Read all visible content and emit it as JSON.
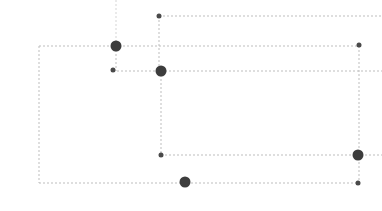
{
  "canvas": {
    "width": 382,
    "height": 211,
    "background": "#ffffff",
    "title": "node-link grid diagram"
  },
  "style": {
    "edge_color": "#bdbdbd",
    "edge_color_faint": "#d5d5d5",
    "edge_width": 1,
    "edge_dash": "2,2",
    "node_color": "#3d3d3d",
    "node_color_soft": "#4a4a4a",
    "node_radius_large": 5.5,
    "node_radius_small": 2.5
  },
  "edges": [
    {
      "id": "e-top-vertical-stub",
      "name": "edge-top-vertical-stub",
      "x1": 116,
      "y1": 0,
      "x2": 116,
      "y2": 46,
      "tone": "faint"
    },
    {
      "id": "e-top-horizontal",
      "name": "edge-top-horizontal",
      "x1": 159,
      "y1": 16,
      "x2": 382,
      "y2": 16,
      "tone": "normal"
    },
    {
      "id": "e-node-b-vertical",
      "name": "edge-node-b-vertical",
      "x1": 159,
      "y1": 16,
      "x2": 159,
      "y2": 71,
      "tone": "normal"
    },
    {
      "id": "e-outer-rect-top",
      "name": "edge-outer-rect-top",
      "x1": 39,
      "y1": 46,
      "x2": 359,
      "y2": 46,
      "tone": "normal"
    },
    {
      "id": "e-outer-rect-left",
      "name": "edge-outer-rect-left",
      "x1": 39,
      "y1": 46,
      "x2": 39,
      "y2": 183,
      "tone": "normal"
    },
    {
      "id": "e-outer-rect-bottom",
      "name": "edge-outer-rect-bottom",
      "x1": 39,
      "y1": 183,
      "x2": 359,
      "y2": 183,
      "tone": "normal"
    },
    {
      "id": "e-right-rect-right",
      "name": "edge-right-rect-right",
      "x1": 359,
      "y1": 46,
      "x2": 359,
      "y2": 183,
      "tone": "normal"
    },
    {
      "id": "e-mid-horizontal",
      "name": "edge-mid-horizontal",
      "x1": 113,
      "y1": 71,
      "x2": 382,
      "y2": 71,
      "tone": "normal"
    },
    {
      "id": "e-node-a-vertical",
      "name": "edge-node-a-vertical",
      "x1": 116,
      "y1": 46,
      "x2": 116,
      "y2": 71,
      "tone": "normal"
    },
    {
      "id": "e-inner-rect-left",
      "name": "edge-inner-rect-left",
      "x1": 161,
      "y1": 71,
      "x2": 161,
      "y2": 155,
      "tone": "normal"
    },
    {
      "id": "e-inner-rect-bottom",
      "name": "edge-inner-rect-bottom",
      "x1": 161,
      "y1": 155,
      "x2": 382,
      "y2": 155,
      "tone": "normal"
    },
    {
      "id": "e-bottom-mid-vertical",
      "name": "edge-bottom-mid-vertical",
      "x1": 185,
      "y1": 183,
      "x2": 185,
      "y2": 183,
      "tone": "normal"
    }
  ],
  "nodes": [
    {
      "id": "n1",
      "name": "node-junction-upper-left",
      "x": 116,
      "y": 46,
      "size": "large",
      "label": ""
    },
    {
      "id": "n2",
      "name": "node-endpoint-top",
      "x": 159,
      "y": 16,
      "size": "small",
      "label": ""
    },
    {
      "id": "n3",
      "name": "node-junction-center",
      "x": 161,
      "y": 71,
      "size": "large",
      "label": ""
    },
    {
      "id": "n4",
      "name": "node-endpoint-left-mid",
      "x": 113,
      "y": 70,
      "size": "small",
      "label": ""
    },
    {
      "id": "n5",
      "name": "node-endpoint-upper-right",
      "x": 359,
      "y": 45,
      "size": "small",
      "label": ""
    },
    {
      "id": "n6",
      "name": "node-junction-lower-right",
      "x": 358,
      "y": 155,
      "size": "large",
      "label": ""
    },
    {
      "id": "n7",
      "name": "node-endpoint-bottom-right",
      "x": 358,
      "y": 183,
      "size": "small",
      "label": ""
    },
    {
      "id": "n8",
      "name": "node-endpoint-inner-lower-left",
      "x": 161,
      "y": 155,
      "size": "small",
      "label": ""
    },
    {
      "id": "n9",
      "name": "node-junction-bottom-center",
      "x": 185,
      "y": 182,
      "size": "large",
      "label": ""
    }
  ]
}
